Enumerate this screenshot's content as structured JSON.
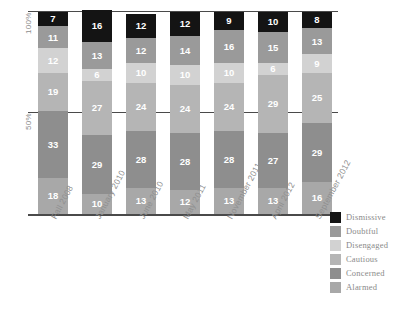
{
  "chart_data": {
    "type": "bar",
    "subtype": "stacked-percentage-column",
    "title": "",
    "subtitle": "",
    "xlabel": "",
    "ylabel": "",
    "ylim": [
      0,
      100
    ],
    "ytick_labels": [
      "100%",
      "50%"
    ],
    "ytick_values": [
      100,
      50
    ],
    "grid": false,
    "gridlines_at": [
      50,
      100
    ],
    "legend_position": "right",
    "value_labels": true,
    "categories": [
      "Fall 2008",
      "January 2010",
      "June 2010",
      "May 2011",
      "November 2011",
      "April 2012",
      "September 2012"
    ],
    "series": [
      {
        "name": "Dismissive",
        "color": "#141414",
        "values": [
          7,
          16,
          12,
          12,
          9,
          10,
          8
        ]
      },
      {
        "name": "Doubtful",
        "color": "#9a9a9a",
        "values": [
          11,
          13,
          12,
          14,
          16,
          15,
          13
        ]
      },
      {
        "name": "Disengaged",
        "color": "#d2d2d2",
        "values": [
          12,
          6,
          10,
          10,
          10,
          6,
          9
        ]
      },
      {
        "name": "Cautious",
        "color": "#b5b5b5",
        "values": [
          19,
          27,
          24,
          24,
          24,
          29,
          25
        ]
      },
      {
        "name": "Concerned",
        "color": "#8e8e8e",
        "values": [
          33,
          29,
          28,
          28,
          28,
          27,
          29
        ]
      },
      {
        "name": "Alarmed",
        "color": "#a8a8a8",
        "values": [
          18,
          10,
          13,
          12,
          13,
          13,
          16
        ]
      }
    ],
    "column_totals": [
      100,
      101,
      99,
      100,
      100,
      100,
      100
    ]
  },
  "legend": {
    "items": [
      {
        "label": "Dismissive",
        "color": "#141414"
      },
      {
        "label": "Doubtful",
        "color": "#9a9a9a"
      },
      {
        "label": "Disengaged",
        "color": "#d2d2d2"
      },
      {
        "label": "Cautious",
        "color": "#b5b5b5"
      },
      {
        "label": "Concerned",
        "color": "#8e8e8e"
      },
      {
        "label": "Alarmed",
        "color": "#a8a8a8"
      }
    ]
  },
  "axis": {
    "y_top_label": "100%",
    "y_mid_label": "50%"
  }
}
